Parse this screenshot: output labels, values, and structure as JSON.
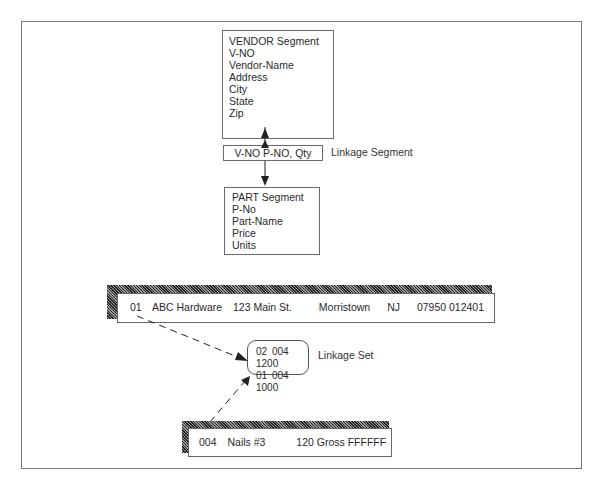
{
  "diagram": {
    "vendor_segment": {
      "title": "VENDOR Segment",
      "fields": [
        "V-NO",
        "Vendor-Name",
        "Address",
        "City",
        "State",
        "Zip"
      ]
    },
    "linkage_segment": {
      "content": "V-NO P-NO, Qty",
      "label": "Linkage Segment"
    },
    "part_segment": {
      "title": "PART Segment",
      "fields": [
        "P-No",
        "Part-Name",
        "Price",
        "Units"
      ]
    },
    "vendor_record": {
      "values": [
        "01",
        "ABC Hardware",
        "123 Main St.",
        "Morristown",
        "NJ",
        "07950 012401"
      ]
    },
    "linkage_set": {
      "label": "Linkage Set",
      "rows": [
        [
          "02",
          "004",
          "1200"
        ],
        [
          "01",
          "004",
          "1000"
        ]
      ]
    },
    "part_record": {
      "values": [
        "004",
        "Nails #3",
        "120 Gross FFFFFF"
      ]
    }
  }
}
